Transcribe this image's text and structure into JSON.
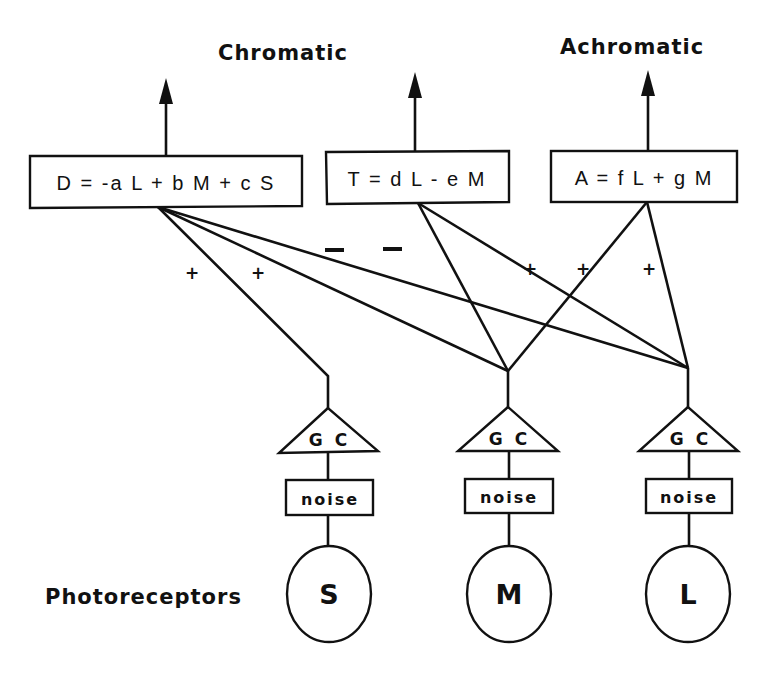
{
  "outputs": {
    "chromatic_label": "Chromatic",
    "achromatic_label": "Achromatic"
  },
  "channels": [
    {
      "id": "D",
      "formula": "D = -a L + b M + c S"
    },
    {
      "id": "T",
      "formula": "T = d L - e M"
    },
    {
      "id": "A",
      "formula": "A = f L + g M"
    }
  ],
  "signs": {
    "d_from_s": "+",
    "d_from_m": "+",
    "d_from_l": "–",
    "t_from_m": "–",
    "t_from_l": "+",
    "a_from_m": "+",
    "a_from_l": "+"
  },
  "stages": {
    "gain_control_label": "G C",
    "noise_label": "noise"
  },
  "photoreceptors": {
    "label": "Photoreceptors",
    "cones": [
      "S",
      "M",
      "L"
    ]
  }
}
